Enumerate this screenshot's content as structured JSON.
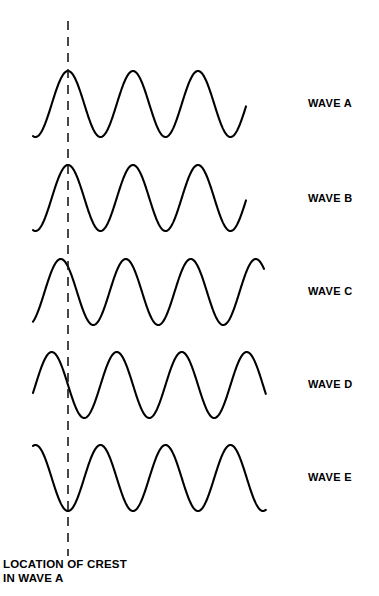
{
  "figure": {
    "background_color": "#ffffff",
    "stroke_color": "#000000",
    "width": 379,
    "height": 596
  },
  "reference_line": {
    "name": "location-of-crest-line",
    "style": "dashed",
    "x": 68,
    "y_top": 21,
    "y_bottom": 556,
    "color": "#1a1a1a"
  },
  "caption": {
    "line1": "LOCATION OF CREST",
    "line2": "IN WAVE A"
  },
  "labels": [
    {
      "text": "WAVE A",
      "x": 308,
      "y": 104
    },
    {
      "text": "WAVE B",
      "x": 308,
      "y": 199
    },
    {
      "text": "WAVE C",
      "x": 308,
      "y": 292
    },
    {
      "text": "WAVE D",
      "x": 308,
      "y": 385
    },
    {
      "text": "WAVE E",
      "x": 308,
      "y": 478
    }
  ],
  "chart_data": {
    "type": "line",
    "xlabel": "",
    "ylabel": "",
    "grid": false,
    "legend_position": "right",
    "annotations": [
      {
        "text": "LOCATION OF CREST IN WAVE A",
        "type": "vertical-dashed-reference-line",
        "x": 68
      }
    ],
    "reference_x": 68,
    "series": [
      {
        "name": "WAVE A",
        "label": "WAVE A",
        "baseline_y": 104,
        "amplitude": 33,
        "wavelength": 65,
        "phase_degrees": 0,
        "phase_description": "crest exactly on reference line; in phase with Wave A",
        "x_start": 33,
        "x_end": 246,
        "crest_y": 71,
        "trough_y": 137,
        "crest_x_positions": [
          68,
          133,
          198
        ],
        "trough_x_positions": [
          100,
          165,
          230
        ]
      },
      {
        "name": "WAVE B",
        "label": "WAVE B",
        "baseline_y": 198,
        "amplitude": 33,
        "wavelength": 65,
        "phase_degrees": 0,
        "phase_description": "crest exactly on reference line; in phase with Wave A",
        "x_start": 33,
        "x_end": 246,
        "crest_y": 165,
        "trough_y": 231,
        "crest_x_positions": [
          68,
          133,
          198
        ],
        "trough_x_positions": [
          100,
          165,
          230
        ]
      },
      {
        "name": "WAVE C",
        "label": "WAVE C",
        "baseline_y": 292,
        "amplitude": 33,
        "wavelength": 65,
        "phase_degrees": 40,
        "phase_description": "crest shifted slightly right of the reference line; small phase lag",
        "x_start": 33,
        "x_end": 264,
        "crest_y": 259,
        "trough_y": 325,
        "crest_x_positions": [
          75,
          140,
          205
        ],
        "trough_x_positions": [
          108,
          173,
          238
        ]
      },
      {
        "name": "WAVE D",
        "label": "WAVE D",
        "baseline_y": 385,
        "amplitude": 33,
        "wavelength": 65,
        "phase_degrees": 90,
        "phase_description": "reference line crosses the rising edge; quarter-wavelength lag behind Wave A",
        "x_start": 33,
        "x_end": 266,
        "crest_y": 352,
        "trough_y": 418,
        "crest_x_positions": [
          85,
          150,
          215
        ],
        "trough_x_positions": [
          52,
          117,
          182,
          247
        ]
      },
      {
        "name": "WAVE E",
        "label": "WAVE E",
        "baseline_y": 478,
        "amplitude": 33,
        "wavelength": 65,
        "phase_degrees": 180,
        "phase_description": "trough exactly on the reference line; completely out of phase with Wave A",
        "x_start": 33,
        "x_end": 266,
        "crest_y": 445,
        "trough_y": 511,
        "crest_x_positions": [
          101,
          166,
          231
        ],
        "trough_x_positions": [
          68,
          133,
          198,
          263
        ]
      }
    ]
  }
}
